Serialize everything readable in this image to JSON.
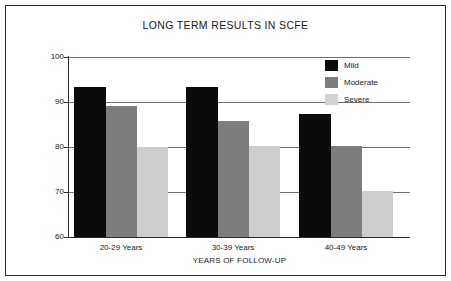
{
  "chart_data": {
    "type": "bar",
    "title": "LONG TERM RESULTS IN SCFE",
    "xlabel": "YEARS OF FOLLOW-UP",
    "ylabel": "IOWA HIP RATING",
    "categories": [
      "20-29 Years",
      "30-39 Years",
      "40-49 Years"
    ],
    "series": [
      {
        "name": "Mild",
        "color": "#0b0b0b",
        "values": [
          93.3,
          93.4,
          87.4
        ]
      },
      {
        "name": "Moderate",
        "color": "#7d7d7d",
        "values": [
          89.1,
          85.7,
          80.2
        ]
      },
      {
        "name": "Severe",
        "color": "#cdcdcd",
        "values": [
          80.0,
          80.2,
          70.2
        ]
      }
    ],
    "ylim": [
      60,
      100
    ],
    "yticks": [
      "100",
      "90",
      "80",
      "70",
      "60"
    ],
    "ytick_values": [
      100,
      90,
      80,
      70,
      60
    ],
    "grid": true,
    "legend_position": "top-right"
  },
  "legend": {
    "items": [
      {
        "label": "Mild"
      },
      {
        "label": "Moderate"
      },
      {
        "label": "Severe"
      }
    ]
  }
}
